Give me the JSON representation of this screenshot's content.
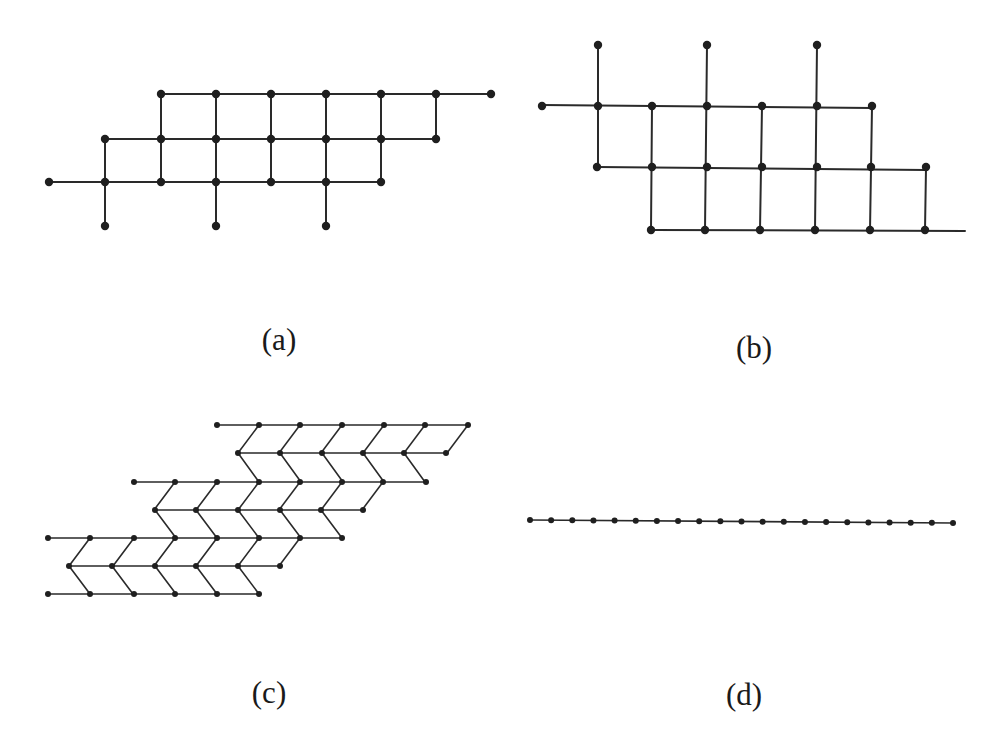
{
  "figure": {
    "panels": [
      {
        "id": "a",
        "label": "(a)",
        "label_pos": [
          279,
          340
        ],
        "node_radius": 4.2,
        "edge_class": "edge",
        "rows": [
          {
            "y": 94,
            "xs": [
              161,
              216,
              271,
              326,
              381,
              436,
              491
            ]
          },
          {
            "y": 139,
            "xs": [
              105,
              161,
              216,
              271,
              326,
              381,
              436
            ]
          },
          {
            "y": 182,
            "xs": [
              49,
              105,
              161,
              216,
              271,
              326,
              381
            ]
          },
          {
            "y": 226,
            "xs": [
              105,
              216,
              326
            ]
          }
        ],
        "h_edges": [
          [
            161,
            94,
            491,
            94
          ],
          [
            105,
            139,
            436,
            139
          ],
          [
            49,
            182,
            381,
            182
          ]
        ],
        "v_edges": [
          [
            105,
            139,
            105,
            226
          ],
          [
            161,
            94,
            161,
            182
          ],
          [
            216,
            94,
            216,
            226
          ],
          [
            271,
            94,
            271,
            182
          ],
          [
            326,
            94,
            326,
            226
          ],
          [
            381,
            94,
            381,
            182
          ],
          [
            436,
            94,
            436,
            139
          ]
        ]
      },
      {
        "id": "b",
        "label": "(b)",
        "label_pos": [
          754,
          348
        ],
        "node_radius": 4.2,
        "edge_class": "edge",
        "rows": [
          {
            "y": 45,
            "xs": [
              598,
              707,
              817
            ]
          },
          {
            "y": 106,
            "xs": [
              542,
              598,
              652,
              707,
              762,
              817,
              872
            ]
          },
          {
            "y": 167,
            "xs": [
              597,
              652,
              707,
              762,
              817,
              871,
              926
            ]
          },
          {
            "y": 230,
            "xs": [
              651,
              705,
              760,
              815,
              870,
              925
            ]
          }
        ],
        "h_edges": [
          [
            542,
            105,
            872,
            108
          ],
          [
            597,
            167,
            926,
            170
          ],
          [
            651,
            230,
            965,
            231
          ]
        ],
        "v_edges": [
          [
            598,
            45,
            598,
            167
          ],
          [
            652,
            106,
            651,
            230
          ],
          [
            707,
            45,
            705,
            230
          ],
          [
            762,
            106,
            760,
            230
          ],
          [
            817,
            45,
            815,
            230
          ],
          [
            872,
            107,
            870,
            230
          ],
          [
            926,
            168,
            925,
            230
          ]
        ]
      },
      {
        "id": "c",
        "label": "(c)",
        "label_pos": [
          269,
          693
        ],
        "node_radius": 3,
        "edge_class": "edge-thin",
        "rows": [
          {
            "y": 425,
            "xs": [
              217,
              259,
              300,
              342,
              384,
              425,
              468
            ]
          },
          {
            "y": 453,
            "xs": [
              238,
              280,
              322,
              363,
              404,
              446
            ]
          },
          {
            "y": 482,
            "xs": [
              134,
              175,
              217,
              259,
              300,
              342,
              383,
              426
            ]
          },
          {
            "y": 510,
            "xs": [
              155,
              196,
              238,
              280,
              321,
              363
            ]
          },
          {
            "y": 538,
            "xs": [
              48,
              90,
              134,
              175,
              217,
              259,
              300,
              342
            ]
          },
          {
            "y": 566,
            "xs": [
              69,
              112,
              155,
              196,
              238,
              280
            ]
          },
          {
            "y": 594,
            "xs": [
              48,
              90,
              134,
              175,
              217,
              259
            ]
          }
        ],
        "h_edges": [
          [
            217,
            425,
            468,
            425
          ],
          [
            238,
            453,
            446,
            453
          ],
          [
            134,
            482,
            426,
            482
          ],
          [
            155,
            510,
            363,
            510
          ],
          [
            48,
            538,
            342,
            538
          ],
          [
            69,
            566,
            280,
            566
          ],
          [
            48,
            594,
            259,
            594
          ]
        ],
        "chevrons": [
          {
            "top_y": 425,
            "mid_y": 453,
            "bot_y": 482,
            "down_left_from": [
              259,
              300,
              342,
              384,
              425,
              468
            ],
            "down_right_from": [
              238,
              280,
              322,
              363,
              404
            ]
          },
          {
            "top_y": 482,
            "mid_y": 510,
            "bot_y": 538,
            "down_left_from": [
              175,
              217,
              259,
              300,
              342,
              383
            ],
            "down_right_from": [
              155,
              196,
              238,
              280,
              321
            ]
          },
          {
            "top_y": 538,
            "mid_y": 566,
            "bot_y": 594,
            "down_left_from": [
              90,
              134,
              175,
              217,
              259,
              300
            ],
            "down_right_from": [
              69,
              112,
              155,
              196,
              238
            ]
          }
        ],
        "chevron_offset": 21
      },
      {
        "id": "d",
        "label": "(d)",
        "label_pos": [
          744,
          695
        ],
        "node_radius": 3,
        "edge_class": "edge-thin",
        "chain": {
          "x_start": 530,
          "y_start": 520,
          "x_end": 953,
          "y_end": 523,
          "count": 21
        }
      }
    ]
  }
}
